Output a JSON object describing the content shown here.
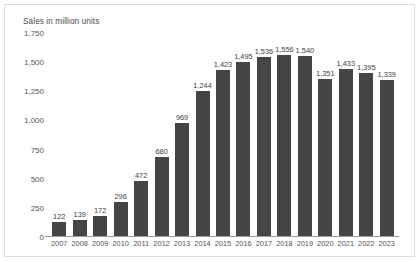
{
  "chart_data": {
    "type": "bar",
    "title": "Sales in million units",
    "xlabel": "",
    "ylabel": "Sales in million units",
    "categories": [
      "2007",
      "2008",
      "2009",
      "2010",
      "2011",
      "2012",
      "2013",
      "2014",
      "2015",
      "2016",
      "2017",
      "2018",
      "2019",
      "2020",
      "2021",
      "2022",
      "2023"
    ],
    "values": [
      122,
      139,
      172,
      296,
      472,
      680,
      969,
      1244,
      1423,
      1495,
      1536,
      1556,
      1540,
      1351,
      1433,
      1395,
      1339
    ],
    "value_labels": [
      "122",
      "139",
      "172",
      "296",
      "472",
      "680",
      "969",
      "1,244",
      "1,423",
      "1,495",
      "1,536",
      "1,556",
      "1,540",
      "1,351",
      "1,433",
      "1,395",
      "1,339"
    ],
    "ylim": [
      0,
      1750
    ],
    "ytick_values": [
      0,
      250,
      500,
      750,
      1000,
      1250,
      1500,
      1750
    ],
    "ytick_labels": [
      "0",
      "250",
      "500",
      "750",
      "1,000",
      "1,250",
      "1,500",
      "1,750"
    ],
    "grid": false,
    "legend": false,
    "legend_position": "none",
    "bar_color": "#454545",
    "axis_color": "#9a9a9a",
    "text_color": "#4a4a4a",
    "border_color": "#dcdcdc"
  }
}
